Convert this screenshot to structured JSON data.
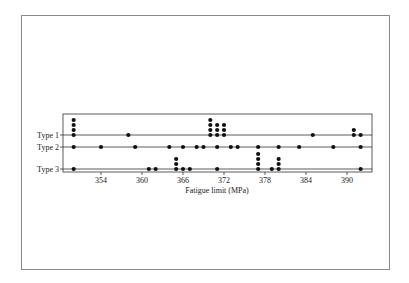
{
  "chart_data": {
    "type": "scatter",
    "subtype": "dot-plot",
    "title": "",
    "xlabel": "Fatigue limit (MPa)",
    "ylabel": "",
    "xlim": [
      347,
      393.5
    ],
    "xticks": [
      354,
      360,
      366,
      372,
      378,
      384,
      390
    ],
    "categories": [
      "Type 1",
      "Type 2",
      "Type 3"
    ],
    "series": [
      {
        "name": "Type 1",
        "points": [
          {
            "x": 350,
            "count": 4
          },
          {
            "x": 358,
            "count": 1
          },
          {
            "x": 370,
            "count": 4
          },
          {
            "x": 371,
            "count": 3
          },
          {
            "x": 372,
            "count": 3
          },
          {
            "x": 385,
            "count": 1
          },
          {
            "x": 391,
            "count": 2
          },
          {
            "x": 392,
            "count": 1
          }
        ]
      },
      {
        "name": "Type 2",
        "points": [
          {
            "x": 350,
            "count": 1
          },
          {
            "x": 354,
            "count": 1
          },
          {
            "x": 359,
            "count": 1
          },
          {
            "x": 364,
            "count": 1
          },
          {
            "x": 366,
            "count": 1
          },
          {
            "x": 368,
            "count": 1
          },
          {
            "x": 369,
            "count": 1
          },
          {
            "x": 371,
            "count": 1
          },
          {
            "x": 373,
            "count": 1
          },
          {
            "x": 374,
            "count": 1
          },
          {
            "x": 377,
            "count": 1
          },
          {
            "x": 380,
            "count": 1
          },
          {
            "x": 383,
            "count": 1
          },
          {
            "x": 388,
            "count": 1
          },
          {
            "x": 392,
            "count": 1
          }
        ]
      },
      {
        "name": "Type 3",
        "points": [
          {
            "x": 350,
            "count": 1
          },
          {
            "x": 361,
            "count": 1
          },
          {
            "x": 362,
            "count": 1
          },
          {
            "x": 365,
            "count": 3
          },
          {
            "x": 366,
            "count": 1
          },
          {
            "x": 367,
            "count": 1
          },
          {
            "x": 371,
            "count": 1
          },
          {
            "x": 377,
            "count": 4
          },
          {
            "x": 379,
            "count": 1
          },
          {
            "x": 380,
            "count": 3
          },
          {
            "x": 392,
            "count": 1
          }
        ]
      }
    ],
    "grid": false,
    "legend": "none",
    "colors": {
      "dot": "#111111",
      "axis": "#333333",
      "frame": "#8a8a8a"
    }
  }
}
